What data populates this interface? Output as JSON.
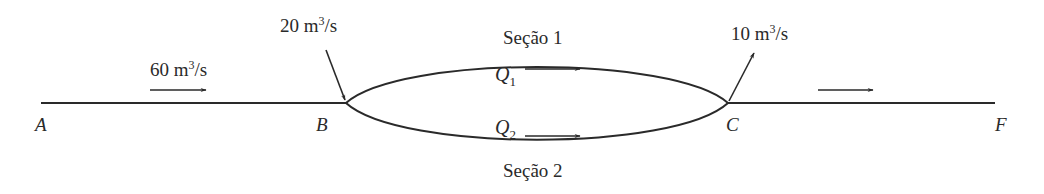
{
  "diagram": {
    "type": "pipe-network",
    "nodes": [
      {
        "id": "A",
        "label": "A"
      },
      {
        "id": "B",
        "label": "B"
      },
      {
        "id": "C",
        "label": "C"
      },
      {
        "id": "F",
        "label": "F"
      }
    ],
    "flows": {
      "inlet_main": {
        "value": "60",
        "unit_base": "m",
        "unit_exp": "3",
        "unit_tail": "/s"
      },
      "inflow_B": {
        "value": "20",
        "unit_base": "m",
        "unit_exp": "3",
        "unit_tail": "/s"
      },
      "outflow_C": {
        "value": "10",
        "unit_base": "m",
        "unit_exp": "3",
        "unit_tail": "/s"
      }
    },
    "sections": [
      {
        "label": "Seção 1",
        "flow_symbol": "Q",
        "flow_sub": "1"
      },
      {
        "label": "Seção 2",
        "flow_symbol": "Q",
        "flow_sub": "2"
      }
    ],
    "colors": {
      "line": "#2a2a2a",
      "background": "#ffffff"
    }
  }
}
